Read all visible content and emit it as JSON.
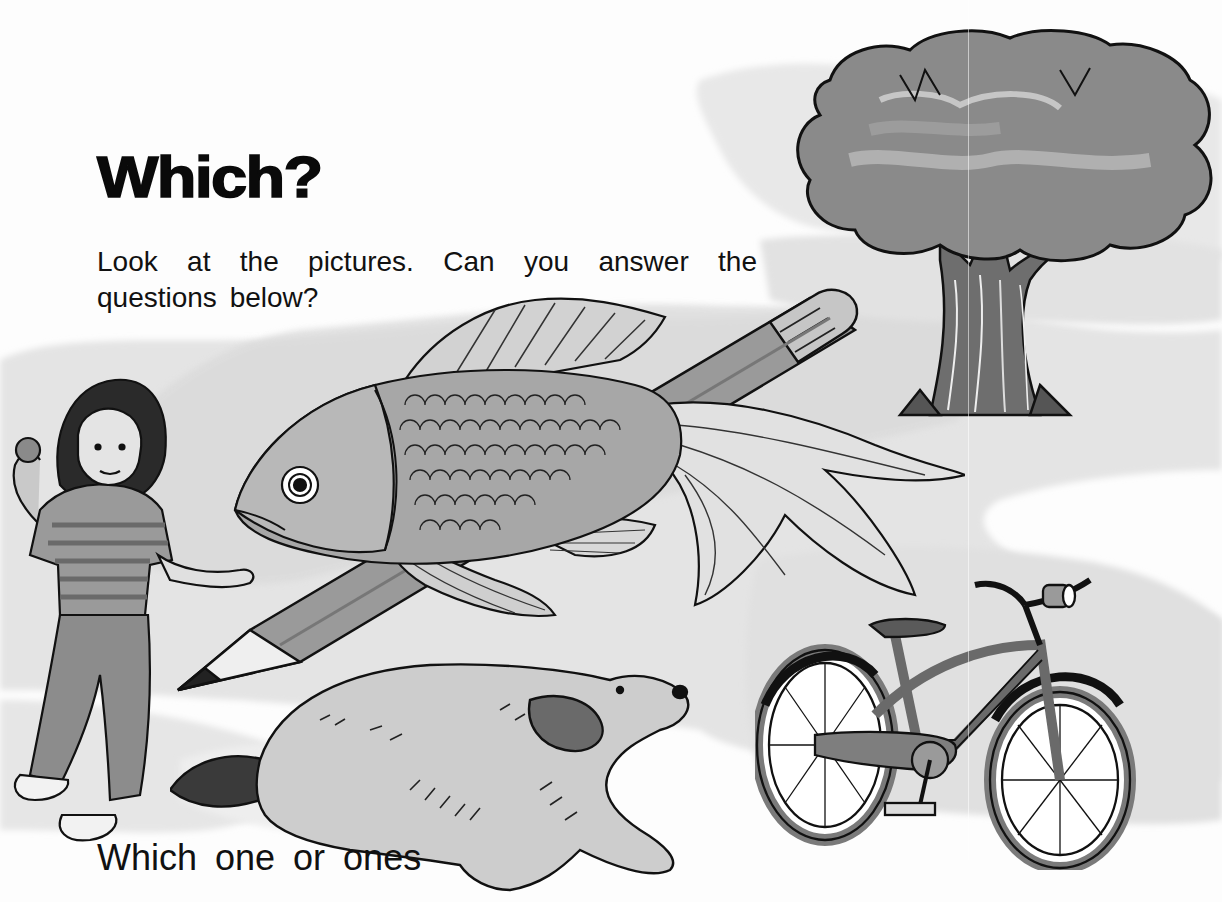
{
  "page": {
    "title": "Which?",
    "intro": {
      "line1": "Look at the pictures. Can you answer the",
      "line2": "questions below?"
    },
    "question_start": "Which one or ones"
  },
  "illustrations": [
    {
      "id": "girl",
      "label": "girl in striped shirt and jeans"
    },
    {
      "id": "goldfish",
      "label": "goldfish"
    },
    {
      "id": "pencil",
      "label": "pencil"
    },
    {
      "id": "dog",
      "label": "running dog"
    },
    {
      "id": "tree",
      "label": "tree"
    },
    {
      "id": "bicycle",
      "label": "bicycle"
    }
  ],
  "colors": {
    "ink": "#111111",
    "wash_light": "#e6e6e6",
    "wash_mid": "#b9b9b9",
    "wash_dark": "#7c7c7c",
    "paper": "#fdfdfd"
  }
}
